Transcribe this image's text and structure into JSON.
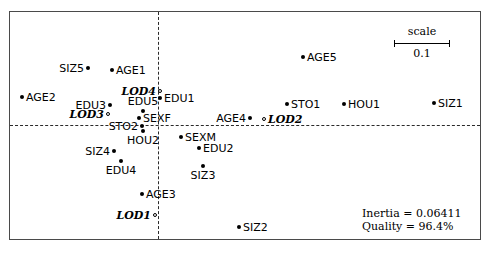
{
  "figure": {
    "title": "",
    "scale_legend": {
      "title": "scale",
      "value": "0.1"
    },
    "stats": {
      "inertia_line": "Inertia = 0.06411",
      "quality_line": "Quality = 96.4%"
    }
  },
  "chart_data": {
    "type": "scatter",
    "title": "",
    "xlabel": "",
    "ylabel": "",
    "grid": false,
    "legend_position": "top-right",
    "axes": {
      "horizontal_axis_style": "dashed",
      "vertical_axis_style": "dashed",
      "origin_x_px": 158,
      "origin_y_px": 125
    },
    "scale_bar": {
      "label": "scale",
      "value": 0.1,
      "length_px": 56
    },
    "annotations": [
      "Inertia = 0.06411",
      "Quality = 96.4%"
    ],
    "marker_types": {
      "filled": "active category (principal)",
      "open": "supplementary category"
    },
    "points": [
      {
        "label": "SIZ5",
        "x_px": 88,
        "y_px": 68,
        "marker": "filled",
        "label_pos": "left",
        "style": "normal"
      },
      {
        "label": "AGE1",
        "x_px": 112,
        "y_px": 70,
        "marker": "filled",
        "label_pos": "right",
        "style": "normal"
      },
      {
        "label": "AGE5",
        "x_px": 303,
        "y_px": 57,
        "marker": "filled",
        "label_pos": "right",
        "style": "normal"
      },
      {
        "label": "AGE2",
        "x_px": 22,
        "y_px": 97,
        "marker": "filled",
        "label_pos": "right",
        "style": "normal"
      },
      {
        "label": "LOD4",
        "x_px": 160,
        "y_px": 91,
        "marker": "open",
        "label_pos": "left",
        "style": "italic"
      },
      {
        "label": "EDU1",
        "x_px": 160,
        "y_px": 98,
        "marker": "filled",
        "label_pos": "right",
        "style": "normal"
      },
      {
        "label": "EDU3",
        "x_px": 110,
        "y_px": 105,
        "marker": "filled",
        "label_pos": "left",
        "style": "normal"
      },
      {
        "label": "EDU5",
        "x_px": 143,
        "y_px": 111,
        "marker": "filled",
        "label_pos": "above",
        "style": "normal"
      },
      {
        "label": "STO1",
        "x_px": 287,
        "y_px": 104,
        "marker": "filled",
        "label_pos": "right",
        "style": "normal"
      },
      {
        "label": "HOU1",
        "x_px": 344,
        "y_px": 104,
        "marker": "filled",
        "label_pos": "right",
        "style": "normal"
      },
      {
        "label": "SIZ1",
        "x_px": 434,
        "y_px": 103,
        "marker": "filled",
        "label_pos": "right",
        "style": "normal"
      },
      {
        "label": "LOD3",
        "x_px": 108,
        "y_px": 114,
        "marker": "open",
        "label_pos": "left",
        "style": "italic"
      },
      {
        "label": "SEXF",
        "x_px": 139,
        "y_px": 118,
        "marker": "filled",
        "label_pos": "right",
        "style": "normal"
      },
      {
        "label": "AGE4",
        "x_px": 250,
        "y_px": 118,
        "marker": "filled",
        "label_pos": "left",
        "style": "normal"
      },
      {
        "label": "LOD2",
        "x_px": 264,
        "y_px": 119,
        "marker": "open",
        "label_pos": "right",
        "style": "italic"
      },
      {
        "label": "STO2",
        "x_px": 142,
        "y_px": 126,
        "marker": "filled",
        "label_pos": "left",
        "style": "normal"
      },
      {
        "label": "HOU2",
        "x_px": 143,
        "y_px": 131,
        "marker": "filled",
        "label_pos": "below",
        "style": "normal"
      },
      {
        "label": "SEXM",
        "x_px": 181,
        "y_px": 137,
        "marker": "filled",
        "label_pos": "right",
        "style": "normal"
      },
      {
        "label": "EDU2",
        "x_px": 199,
        "y_px": 148,
        "marker": "filled",
        "label_pos": "right",
        "style": "normal"
      },
      {
        "label": "SIZ4",
        "x_px": 114,
        "y_px": 151,
        "marker": "filled",
        "label_pos": "left",
        "style": "normal"
      },
      {
        "label": "EDU4",
        "x_px": 121,
        "y_px": 161,
        "marker": "filled",
        "label_pos": "below",
        "style": "normal"
      },
      {
        "label": "SIZ3",
        "x_px": 203,
        "y_px": 166,
        "marker": "filled",
        "label_pos": "below",
        "style": "normal"
      },
      {
        "label": "AGE3",
        "x_px": 142,
        "y_px": 194,
        "marker": "filled",
        "label_pos": "right",
        "style": "normal"
      },
      {
        "label": "LOD1",
        "x_px": 155,
        "y_px": 215,
        "marker": "open",
        "label_pos": "left",
        "style": "italic"
      },
      {
        "label": "SIZ2",
        "x_px": 239,
        "y_px": 227,
        "marker": "filled",
        "label_pos": "right",
        "style": "normal"
      }
    ]
  }
}
